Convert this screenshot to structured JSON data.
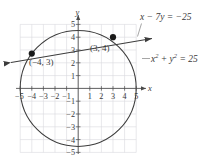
{
  "figure": {
    "type": "graph",
    "axes": {
      "x_axis_label": "x",
      "y_axis_label": "y",
      "x_ticks": [
        "-5",
        "-4",
        "-3",
        "-2",
        "-1",
        "1",
        "2",
        "3",
        "4",
        "5"
      ],
      "y_ticks": [
        "5",
        "4",
        "3",
        "2",
        "1",
        "-1",
        "-2",
        "-3",
        "-4",
        "-5"
      ],
      "xlim": [
        -5.6,
        5.6
      ],
      "ylim": [
        -5.6,
        5.6
      ],
      "grid": true
    },
    "labels": {
      "line_equation_html": "x &minus; 7y = &minus;25",
      "circle_equation_html": "x<sup>2</sup> + y<sup>2</sup> = 25",
      "point_a_label": "(−4, 3)",
      "point_b_label": "(3, 4)"
    },
    "colors": {
      "curve": "#3c3c3c",
      "grid": "#d8d8dc",
      "axis": "#4a4a4a",
      "point": "#1a1a1a",
      "text": "#3a3a3a",
      "background": "#ffffff"
    }
  },
  "chart_data": {
    "type": "scatter",
    "title": "",
    "xlabel": "x",
    "ylabel": "y",
    "xlim": [
      -5.6,
      5.6
    ],
    "ylim": [
      -5.6,
      5.6
    ],
    "grid": true,
    "legend": "none",
    "series": [
      {
        "name": "x^2 + y^2 = 25",
        "kind": "circle",
        "center": [
          0,
          0
        ],
        "radius": 5,
        "annotation": "x² + y² = 25"
      },
      {
        "name": "x - 7y = -25",
        "kind": "line",
        "slope": 0.142857,
        "intercept": 3.571429,
        "annotation": "x − 7y = −25",
        "arrows": [
          "left",
          "right"
        ]
      }
    ],
    "points": [
      {
        "x": -4,
        "y": 3,
        "label": "(−4, 3)",
        "filled": true
      },
      {
        "x": 3,
        "y": 4,
        "label": "(3, 4)",
        "filled": true
      }
    ],
    "xticks": [
      -5,
      -4,
      -3,
      -2,
      -1,
      1,
      2,
      3,
      4,
      5
    ],
    "yticks": [
      5,
      4,
      3,
      2,
      1,
      -1,
      -2,
      -3,
      -4,
      -5
    ]
  }
}
